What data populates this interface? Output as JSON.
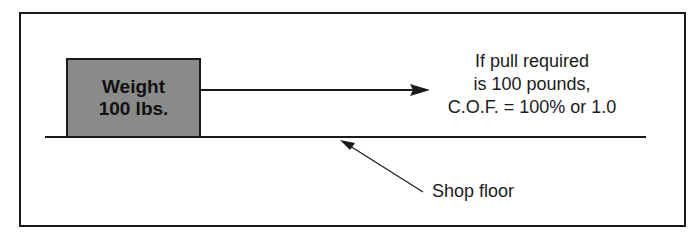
{
  "diagram": {
    "weight_box": {
      "line1": "Weight",
      "line2": "100 lbs.",
      "fill": "#8a8a8a"
    },
    "pull_text": {
      "line1": "If pull required",
      "line2": "is 100 pounds,",
      "line3": "C.O.F. = 100% or 1.0"
    },
    "floor_label": "Shop floor",
    "colors": {
      "stroke": "#1a1a1a",
      "background": "#ffffff"
    }
  }
}
